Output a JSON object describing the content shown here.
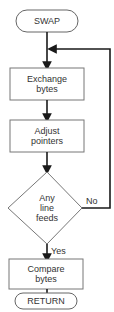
{
  "diagram": {
    "type": "flowchart",
    "nodes": {
      "start": {
        "shape": "terminal",
        "label": "SWAP"
      },
      "exchange": {
        "shape": "process",
        "line1": "Exchange",
        "line2": "bytes"
      },
      "adjust": {
        "shape": "process",
        "line1": "Adjust",
        "line2": "pointers"
      },
      "decision": {
        "shape": "decision",
        "line1": "Any",
        "line2": "line",
        "line3": "feeds"
      },
      "compare": {
        "shape": "process",
        "line1": "Compare",
        "line2": "bytes"
      },
      "end": {
        "shape": "terminal",
        "label": "RETURN"
      }
    },
    "edges": {
      "no_label": "No",
      "yes_label": "Yes"
    },
    "colors": {
      "line": "#1a1a1a",
      "box": "#777777",
      "text": "#333333"
    }
  }
}
